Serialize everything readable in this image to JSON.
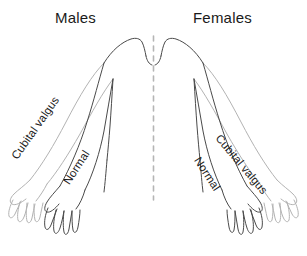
{
  "figure": {
    "title_left": "Males",
    "title_right": "Females",
    "background_color": "#ffffff",
    "labels": {
      "cubital_valgus": "Cubital valgus",
      "normal": "Normal"
    },
    "colors": {
      "outline_dark": "#4a4a4a",
      "outline_light": "#b3b3b3",
      "midline_dash": "#b5b5b5",
      "text": "#1a1a1a"
    },
    "sides": [
      {
        "id": "males",
        "heading": "Males",
        "outer_arm_label": "Cubital valgus",
        "inner_arm_label": "Normal"
      },
      {
        "id": "females",
        "heading": "Females",
        "outer_arm_label": "Cubital valgus",
        "inner_arm_label": "Normal"
      }
    ],
    "midline": {
      "name": "body-midline",
      "style": "dashed",
      "orientation": "vertical"
    }
  }
}
